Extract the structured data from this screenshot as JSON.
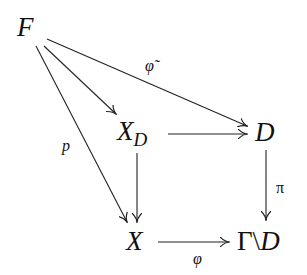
{
  "diagram": {
    "type": "commutative-diagram",
    "nodes": {
      "F": "F",
      "XD_base": "X",
      "XD_sub": "D",
      "D": "D",
      "X": "X",
      "GammaD_gamma": "Γ",
      "GammaD_backslash": "\\",
      "GammaD_D": "D"
    },
    "labels": {
      "phi_tilde": "φ̃",
      "p": "p",
      "pi": "π",
      "phi": "φ"
    },
    "edges": [
      {
        "from": "F",
        "to": "D",
        "label": "φ̃"
      },
      {
        "from": "F",
        "to": "X_D",
        "label": ""
      },
      {
        "from": "F",
        "to": "X",
        "label": "p"
      },
      {
        "from": "X_D",
        "to": "D",
        "label": ""
      },
      {
        "from": "X_D",
        "to": "X",
        "label": ""
      },
      {
        "from": "D",
        "to": "Γ\\D",
        "label": "π"
      },
      {
        "from": "X",
        "to": "Γ\\D",
        "label": "φ"
      }
    ],
    "stroke_color": "#222222"
  }
}
